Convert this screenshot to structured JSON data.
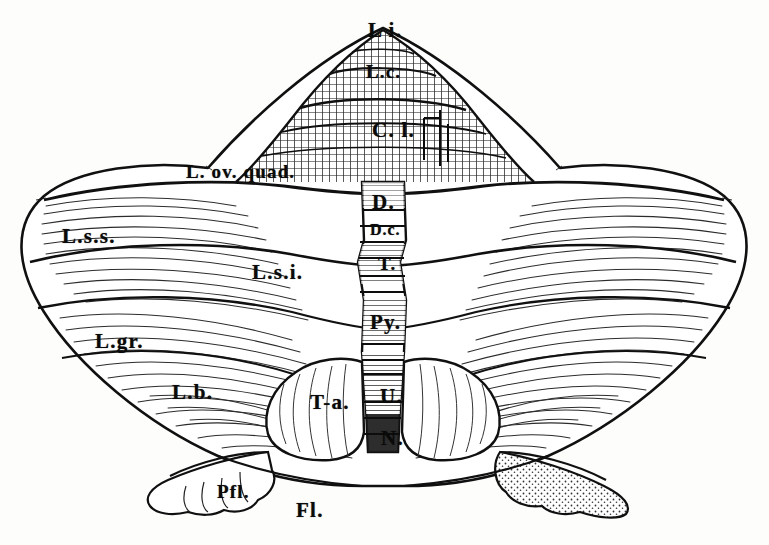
{
  "figure": {
    "medium": "engraving",
    "ink_color": "#101010",
    "paper_color": "#fdfdfb",
    "hatch_color": "#1a1a1a"
  },
  "labels": [
    {
      "id": "lingula",
      "text": "L i.",
      "x": 368,
      "y": 20,
      "size": "lbl-lg"
    },
    {
      "id": "lobulus-centralis",
      "text": "L.c.",
      "x": 366,
      "y": 62,
      "size": "lbl-md"
    },
    {
      "id": "culmen",
      "text": "C. l.",
      "x": 372,
      "y": 120,
      "size": "lbl-lg"
    },
    {
      "id": "lobulus-ovalis-quadrangularis",
      "text": "L. ov. quad.",
      "x": 186,
      "y": 162,
      "size": "lbl-md"
    },
    {
      "id": "declive",
      "text": "D.",
      "x": 372,
      "y": 192,
      "size": "lbl-lg"
    },
    {
      "id": "declive-clivus",
      "text": "D.c.",
      "x": 370,
      "y": 222,
      "size": "lbl-sm"
    },
    {
      "id": "lobulus-semilunaris-superior",
      "text": "L.s.s.",
      "x": 62,
      "y": 226,
      "size": "lbl-lg"
    },
    {
      "id": "tuber",
      "text": "T.",
      "x": 378,
      "y": 254,
      "size": "lbl-md"
    },
    {
      "id": "lobulus-semilunaris-inferior",
      "text": "L.s.i.",
      "x": 252,
      "y": 262,
      "size": "lbl-lg"
    },
    {
      "id": "pyramis",
      "text": "Py.",
      "x": 370,
      "y": 312,
      "size": "lbl-lg"
    },
    {
      "id": "lobulus-gracilis",
      "text": "L.gr.",
      "x": 95,
      "y": 331,
      "size": "lbl-lg"
    },
    {
      "id": "lobulus-biventer",
      "text": "L.b.",
      "x": 172,
      "y": 382,
      "size": "lbl-lg"
    },
    {
      "id": "tonsilla",
      "text": "T-a.",
      "x": 310,
      "y": 392,
      "size": "lbl-lg"
    },
    {
      "id": "uvula",
      "text": "U.",
      "x": 380,
      "y": 386,
      "size": "lbl-lg"
    },
    {
      "id": "nodulus",
      "text": "N.",
      "x": 381,
      "y": 428,
      "size": "lbl-lg"
    },
    {
      "id": "paraflocculus",
      "text": "Pfl.",
      "x": 217,
      "y": 482,
      "size": "lbl-md"
    },
    {
      "id": "flocculus",
      "text": "Fl.",
      "x": 296,
      "y": 500,
      "size": "lbl-lg"
    }
  ]
}
